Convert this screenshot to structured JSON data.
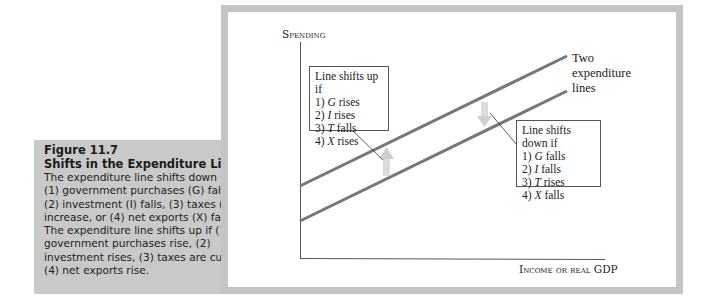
{
  "caption": {
    "figure_number": "Figure 11.7",
    "title": "Shifts in the Expenditure Line",
    "body": "The expenditure line shifts down if (1) government purchases (G) fall, (2) investment (I) falls, (3) taxes (T) increase, or (4) net exports (X) fall. The expenditure line shifts up if (1) government purchases rise, (2) investment rises, (3) taxes are cut, or (4) net exports rise."
  },
  "chart": {
    "y_axis_label": "Spending",
    "x_axis_label": "Income or real GDP",
    "line_label": [
      "Two",
      "expenditure",
      "lines"
    ],
    "up_box": {
      "title": "Line shifts up if",
      "items": [
        {
          "num": "1)",
          "var": "G",
          "text": "rises"
        },
        {
          "num": "2)",
          "var": "I",
          "text": "rises"
        },
        {
          "num": "3)",
          "var": "T",
          "text": "falls"
        },
        {
          "num": "4)",
          "var": "X",
          "text": "rises"
        }
      ]
    },
    "down_box": {
      "title": "Line shifts down if",
      "items": [
        {
          "num": "1)",
          "var": "G",
          "text": "falls"
        },
        {
          "num": "2)",
          "var": "I",
          "text": "falls"
        },
        {
          "num": "3)",
          "var": "T",
          "text": "rises"
        },
        {
          "num": "4)",
          "var": "X",
          "text": "falls"
        }
      ]
    },
    "colors": {
      "line": "#777777",
      "arrow": "#d0d0d0",
      "frame": "#c4c4c4",
      "caption_bg": "#c9c9c9"
    }
  }
}
